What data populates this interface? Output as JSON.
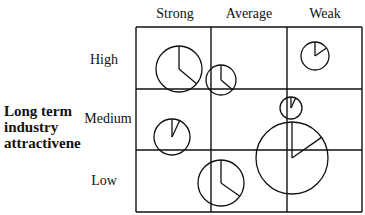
{
  "title_partial": "",
  "columns": [
    "Strong",
    "Average",
    "Weak"
  ],
  "rows": [
    "High",
    "Medium",
    "Low"
  ],
  "y_axis_label": [
    "Long term",
    "industry",
    "attractivene"
  ],
  "colors": {
    "line": "#111111",
    "background": "#ffffff"
  },
  "grid": {
    "x": [
      136,
      211,
      287,
      362
    ],
    "y": [
      27,
      89,
      150,
      212
    ]
  },
  "bubbles": [
    {
      "cx": 179,
      "cy": 69,
      "r": 23,
      "slice_deg": 130
    },
    {
      "cx": 221,
      "cy": 80,
      "r": 15,
      "slice_deg": 130
    },
    {
      "cx": 315,
      "cy": 56,
      "r": 14,
      "slice_deg": 55
    },
    {
      "cx": 291,
      "cy": 108,
      "r": 11,
      "slice_deg": 25
    },
    {
      "cx": 172,
      "cy": 137,
      "r": 18,
      "slice_deg": 25
    },
    {
      "cx": 292,
      "cy": 158,
      "r": 36,
      "slice_deg": 55
    },
    {
      "cx": 221,
      "cy": 183,
      "r": 23,
      "slice_deg": 125
    }
  ]
}
